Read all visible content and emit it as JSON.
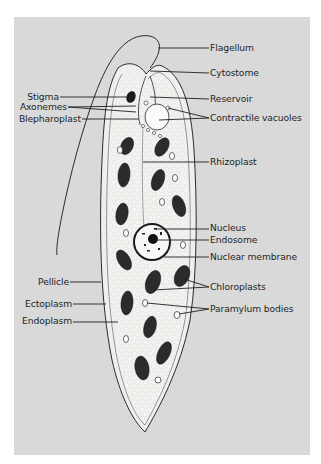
{
  "diagram": {
    "colors": {
      "background": "#ffffff",
      "panel": "#d9d9d9",
      "cell_fill": "#f2f2f0",
      "outline": "#2a2a2a",
      "chloroplast": "#2b2b2b",
      "label_text": "#1f1f1f"
    },
    "labels_right": [
      {
        "id": "flagellum",
        "text": "Flagellum"
      },
      {
        "id": "cytostome",
        "text": "Cytostome"
      },
      {
        "id": "reservoir",
        "text": "Reservoir"
      },
      {
        "id": "contractile-vacuoles",
        "text": "Contractile vacuoles"
      },
      {
        "id": "rhizoplast",
        "text": "Rhizoplast"
      },
      {
        "id": "nucleus",
        "text": "Nucleus"
      },
      {
        "id": "endosome",
        "text": "Endosome"
      },
      {
        "id": "nuclear-membrane",
        "text": "Nuclear membrane"
      },
      {
        "id": "chloroplasts",
        "text": "Chloroplasts"
      },
      {
        "id": "paramylum-bodies",
        "text": "Paramylum bodies"
      }
    ],
    "labels_left": [
      {
        "id": "stigma",
        "text": "Stigma"
      },
      {
        "id": "axonemes",
        "text": "Axonemes"
      },
      {
        "id": "blepharoplast",
        "text": "Blepharoplast"
      },
      {
        "id": "pellicle",
        "text": "Pellicle"
      },
      {
        "id": "ectoplasm",
        "text": "Ectoplasm"
      },
      {
        "id": "endoplasm",
        "text": "Endoplasm"
      }
    ]
  }
}
